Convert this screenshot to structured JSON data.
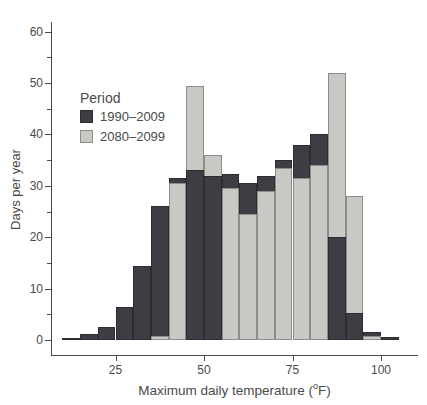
{
  "figure": {
    "background": "#ffffff",
    "text_color": "#4a4a4a",
    "axis_color": "#4b4b4b"
  },
  "legend": {
    "title": "Period",
    "entries": [
      {
        "label": "1990–2009",
        "color": "#3f3d44"
      },
      {
        "label": "2080–2099",
        "color": "#c9c8c4"
      }
    ]
  },
  "xlabel_parts": {
    "pre": "Maximum daily temperature (",
    "sup": "o",
    "post": "F)"
  },
  "chart_data": {
    "type": "bar",
    "subtype": "overlaid-histogram",
    "title": "",
    "xlabel": "Maximum daily temperature (°F)",
    "ylabel": "Days per year",
    "bin_width": 5,
    "bin_starts": [
      10,
      15,
      20,
      25,
      30,
      35,
      40,
      45,
      50,
      55,
      60,
      65,
      70,
      75,
      80,
      85,
      90,
      95,
      100
    ],
    "series": [
      {
        "name": "1990–2009",
        "color": "#3f3d44",
        "values": [
          0.4,
          1.2,
          2.5,
          6.4,
          14.4,
          26,
          31.5,
          33,
          32,
          32.3,
          30.6,
          32,
          35,
          38,
          40,
          20,
          5.2,
          1.6,
          0.5
        ]
      },
      {
        "name": "2080–2099",
        "color": "#c9c8c4",
        "values": [
          0,
          0,
          0,
          0,
          0,
          0.8,
          30.5,
          49.5,
          36,
          29.5,
          24.5,
          29,
          33.5,
          31.5,
          34,
          52,
          28,
          0.7,
          0
        ]
      }
    ],
    "xticks": [
      25,
      50,
      75,
      100
    ],
    "yticks": [
      0,
      10,
      20,
      30,
      40,
      50,
      60
    ],
    "y_minor_step": 5,
    "xlim": [
      8,
      107
    ],
    "ylim": [
      0,
      63
    ],
    "grid": false,
    "legend_position": "upper-left"
  }
}
